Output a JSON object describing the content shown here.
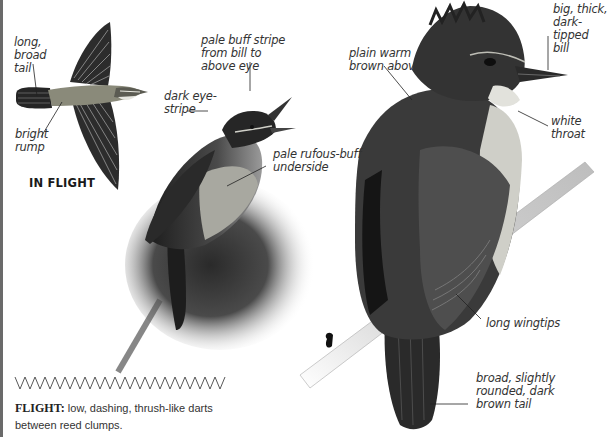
{
  "labels": {
    "long_broad_tail": "long,\nbroad\ntail",
    "bright_rump": "bright\nrump",
    "in_flight": "IN FLIGHT",
    "pale_buff_stripe": "pale buff stripe\nfrom bill to\nabove eye",
    "dark_eye_stripe": "dark eye-\nstripe",
    "pale_rufous_underside": "pale rufous-buff\nunderside",
    "plain_warm_brown": "plain warm\nbrown above",
    "big_thick_bill": "big, thick,\ndark-tipped\nbill",
    "white_throat": "white\nthroat",
    "long_wingtips": "long wingtips",
    "broad_tail": "broad, slightly\nrounded, dark\nbrown tail"
  },
  "flight": {
    "heading": "FLIGHT:",
    "description": " low, dashing, thrush-like darts between reed clumps."
  },
  "colors": {
    "text": "#333333",
    "bird_dark": "#2b2b2b",
    "bird_mid": "#6b6b6b",
    "bird_light": "#d9d9d9",
    "rule": "#6a6a6a"
  }
}
